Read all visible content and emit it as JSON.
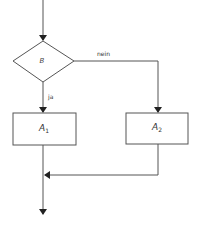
{
  "diagram": {
    "type": "flowchart",
    "condition": {
      "label": "B"
    },
    "branches": {
      "yes_label": "ja",
      "no_label": "nein"
    },
    "actions": [
      {
        "id": "A1",
        "letter": "A",
        "subscript": "1"
      },
      {
        "id": "A2",
        "letter": "A",
        "subscript": "2"
      }
    ],
    "colors": {
      "stroke": "#555555",
      "arrow": "#222222",
      "background": "#ffffff"
    }
  }
}
